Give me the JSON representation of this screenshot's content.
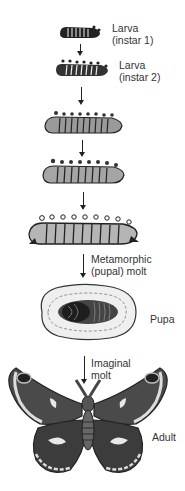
{
  "stages": [
    {
      "id": "larva1",
      "label_line1": "Larva",
      "label_line2": "(instar 1)"
    },
    {
      "id": "larva2",
      "label_line1": "Larva",
      "label_line2": "(instar 2)"
    },
    {
      "id": "larva3",
      "label_line1": "",
      "label_line2": ""
    },
    {
      "id": "larva4",
      "label_line1": "",
      "label_line2": ""
    },
    {
      "id": "larva5",
      "label_line1": "",
      "label_line2": ""
    },
    {
      "id": "pupa",
      "label_line1": "Pupa",
      "label_line2": ""
    },
    {
      "id": "adult",
      "label_line1": "Adult",
      "label_line2": ""
    }
  ],
  "transitions": [
    {
      "from": "larva5",
      "to": "pupa",
      "label_line1": "Metamorphic",
      "label_line2": "(pupal) molt"
    },
    {
      "from": "pupa",
      "to": "adult",
      "label_line1": "Imaginal",
      "label_line2": "molt"
    }
  ],
  "colors": {
    "ink": "#1e1e1e",
    "mid": "#6b6b6b",
    "light": "#cfcfcf",
    "background": "#ffffff"
  }
}
